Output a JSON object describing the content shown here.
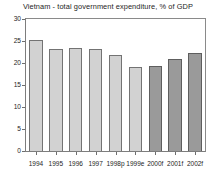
{
  "chart_data": {
    "type": "bar",
    "title": "Vietnam - total government expenditure, % of GDP",
    "xlabel": "",
    "ylabel": "",
    "categories": [
      "1994",
      "1995",
      "1996",
      "1997",
      "1998p",
      "1999e",
      "2000f",
      "2001f",
      "2002f"
    ],
    "values": [
      25.2,
      23.2,
      23.3,
      23.2,
      21.9,
      19.1,
      19.3,
      20.8,
      22.2
    ],
    "series": [
      {
        "name": "total government expenditure, % of GDP",
        "values": [
          25.2,
          23.2,
          23.3,
          23.2,
          21.9,
          19.1,
          19.3,
          20.8,
          22.2
        ]
      }
    ],
    "bar_styles": [
      "light",
      "light",
      "light",
      "light",
      "light",
      "light",
      "dark",
      "dark",
      "dark"
    ],
    "ylim": [
      0,
      30
    ],
    "yticks": [
      0,
      5,
      10,
      15,
      20,
      25,
      30
    ],
    "ytick_labels": [
      "0",
      "5",
      "10",
      "15",
      "20",
      "25",
      "30"
    ],
    "grid": false,
    "legend": false,
    "colors": {
      "bar_light": "#d2d2d2",
      "bar_dark": "#9a9a9a",
      "bar_light_border": "#737373",
      "bar_dark_border": "#5e5e5e",
      "axis": "#7d7d7d",
      "text": "#1d1d1d",
      "background": "#ffffff"
    }
  }
}
